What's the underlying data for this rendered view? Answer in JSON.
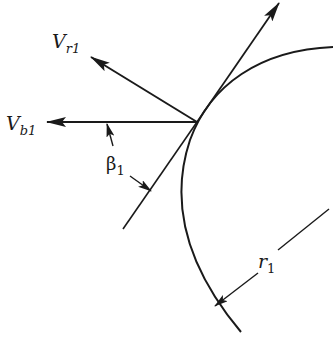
{
  "figure": {
    "colors": {
      "stroke": "#1a1a1a",
      "background": "#ffffff"
    },
    "labels": {
      "v_r1": {
        "main": "V",
        "sub": "r1"
      },
      "v_b1": {
        "main": "V",
        "sub": "b1"
      },
      "beta1": {
        "main": "β",
        "sub": "1"
      },
      "r1": {
        "main": "r",
        "sub": "1"
      }
    },
    "elements": {
      "vectors": [
        "relative-velocity",
        "blade-velocity",
        "absolute-velocity"
      ],
      "blade_tangent": "blade-angle-line",
      "impeller_circle": "inlet-radius-arc",
      "dimensions": [
        "beta1-angle-indicator",
        "r1-radius-indicator"
      ]
    }
  }
}
